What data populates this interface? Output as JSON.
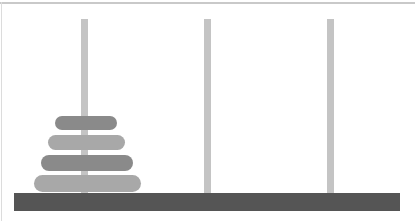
{
  "scene": {
    "title": "Tower of Hanoi",
    "width": 415,
    "height": 221,
    "background_color": "#ffffff",
    "frame": {
      "top_rule_color": "#c9c9c9",
      "left_rule_color": "#dcdcdc"
    }
  },
  "base": {
    "label": "base-bar",
    "color": "#555555",
    "x": 14,
    "y": 193,
    "width": 386,
    "height": 18
  },
  "pegs": [
    {
      "id": "peg-1",
      "label": "A",
      "color": "#c4c4c4",
      "x": 81,
      "y": 19,
      "width": 7,
      "height": 174,
      "disk_count": 4
    },
    {
      "id": "peg-2",
      "label": "B",
      "color": "#c4c4c4",
      "x": 204,
      "y": 19,
      "width": 7,
      "height": 174,
      "disk_count": 0
    },
    {
      "id": "peg-3",
      "label": "C",
      "color": "#c4c4c4",
      "x": 327,
      "y": 19,
      "width": 7,
      "height": 174,
      "disk_count": 0
    }
  ],
  "disks": [
    {
      "id": "disk-1",
      "size": 1,
      "peg": "peg-1",
      "stack_index": 3,
      "color": "#8a8a8a",
      "x": 55,
      "y": 116,
      "width": 62,
      "height": 14
    },
    {
      "id": "disk-2",
      "size": 2,
      "peg": "peg-1",
      "stack_index": 2,
      "color": "#a8a8a8",
      "x": 48,
      "y": 135,
      "width": 77,
      "height": 15
    },
    {
      "id": "disk-3",
      "size": 3,
      "peg": "peg-1",
      "stack_index": 1,
      "color": "#8a8a8a",
      "x": 41,
      "y": 155,
      "width": 92,
      "height": 16
    },
    {
      "id": "disk-4",
      "size": 4,
      "peg": "peg-1",
      "stack_index": 0,
      "color": "#a8a8a8",
      "x": 34,
      "y": 175,
      "width": 107,
      "height": 17
    }
  ]
}
